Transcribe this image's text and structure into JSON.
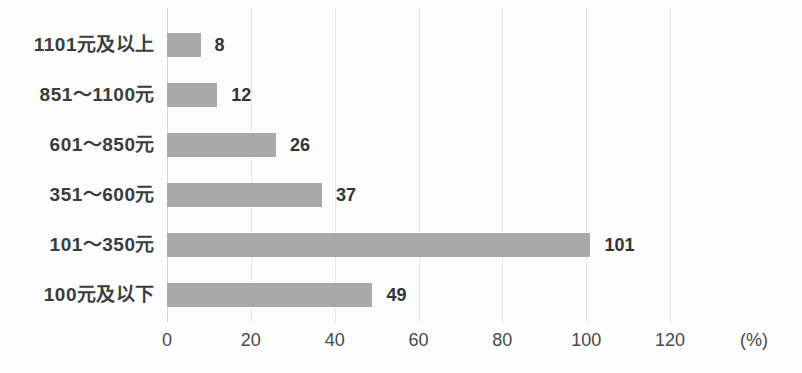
{
  "chart_data": {
    "type": "bar",
    "orientation": "horizontal",
    "title": "",
    "subtitle": "",
    "xlabel": "(%)",
    "ylabel": "",
    "categories": [
      "1101元及以上",
      "851～1100元",
      "601～850元",
      "351～600元",
      "101～350元",
      "100元及以下"
    ],
    "values": [
      8,
      12,
      26,
      37,
      101,
      49
    ],
    "value_labels": [
      "8",
      "12",
      "26",
      "37",
      "101",
      "49"
    ],
    "xlim": [
      0,
      130
    ],
    "xticks": [
      0,
      20,
      40,
      60,
      80,
      100,
      120
    ],
    "xtick_labels": [
      "0",
      "20",
      "40",
      "60",
      "80",
      "100",
      "120"
    ],
    "grid": true,
    "grid_axis": "x",
    "legend": "none",
    "bar_color": "#a9a9a9",
    "grid_color": "#e6e6e6",
    "text_color": "#3a3a3a",
    "background_color": "#fdfdfd"
  }
}
